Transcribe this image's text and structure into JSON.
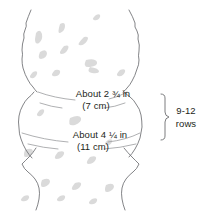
{
  "diagram": {
    "type": "knitting-measurement-schematic",
    "colors": {
      "outline": "#6d6e71",
      "texture": "#d8d8d8",
      "text": "#231f20",
      "measurement_line": "#8a8c8e",
      "bracket": "#6d6e71",
      "background": "#ffffff"
    },
    "measurements": [
      {
        "name": "upper-width",
        "imperial": "About 2 ¾ in",
        "metric": "(7 cm)",
        "position": "upper-arc"
      },
      {
        "name": "lower-width",
        "imperial": "About 4 ¼ in",
        "metric": "(11 cm)",
        "position": "lower-arc"
      }
    ],
    "bracket": {
      "name": "row-count-bracket",
      "count": "9-12",
      "unit": "rows"
    }
  }
}
